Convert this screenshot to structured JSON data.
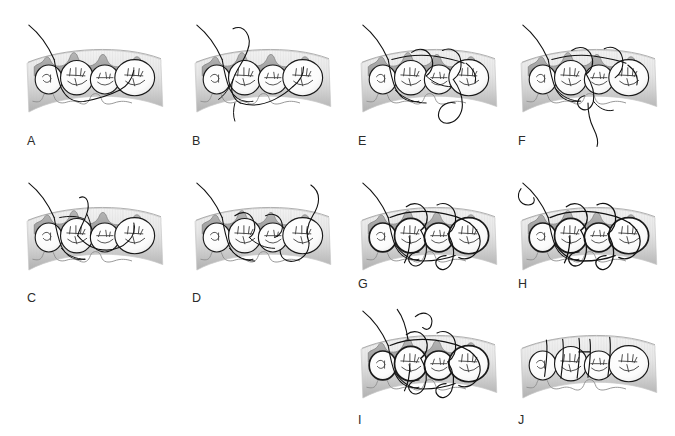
{
  "figure": {
    "background_color": "#ffffff",
    "panel_count": 10,
    "columns": 4,
    "rows": 3,
    "width": 675,
    "height": 436
  },
  "palette": {
    "background": "#ffffff",
    "tooth_fill": "#fdfdfd",
    "tooth_outline": "#1a1a1a",
    "gingiva_fill": "#a9a9a9",
    "gingiva_outline": "#7a7a7a",
    "band_light": "#f2f2f2",
    "band_mid": "#d4d4d4",
    "band_dark": "#b0b0b0",
    "suture_color": "#111111",
    "label_color": "#2b2b2b",
    "occlusal_line": "#444444"
  },
  "anatomy": {
    "arch_description": "curved buccal-occlusal view of a posterior dental arch segment",
    "tooth_count": 4,
    "teeth": [
      {
        "index": 1,
        "name": "premolar-distal-partial",
        "shape": "small-oval"
      },
      {
        "index": 2,
        "name": "first-molar",
        "shape": "large-oval"
      },
      {
        "index": 3,
        "name": "second-molar",
        "shape": "medium-oval"
      },
      {
        "index": 4,
        "name": "third-molar",
        "shape": "large-oval"
      }
    ],
    "gingiva": "scalloped interdental papillae along the crest with a reflected flap",
    "band": "vertically hatched gray mucosal band curving across each panel"
  },
  "panels": [
    {
      "id": "A",
      "label": "A",
      "row": 1,
      "column": 1,
      "x": 18,
      "y": 14,
      "label_x": 27,
      "label_y": 135,
      "caption": "Needle and suture thread enter from the upper left through the gingival flap; no loops formed yet.",
      "suture_elements": [
        "entry-thread-upper-left",
        "thread-under-flap",
        "thread-through-embrasure"
      ],
      "show_flap": true,
      "loops_above": 0,
      "loops_below": 0,
      "tail_below": false
    },
    {
      "id": "B",
      "label": "B",
      "row": 1,
      "column": 2,
      "x": 186,
      "y": 14,
      "label_x": 192,
      "label_y": 135,
      "caption": "Thread is passed back up and a large free loop is raised above the arch crest.",
      "suture_elements": [
        "entry-thread-upper-left",
        "large-loop-above-crest",
        "thread-around-first-molar",
        "thread-below-margin"
      ],
      "show_flap": true,
      "loops_above": 1,
      "loops_below": 1,
      "tail_below": false
    },
    {
      "id": "E",
      "label": "E",
      "row": 1,
      "column": 3,
      "x": 352,
      "y": 14,
      "label_x": 358,
      "label_y": 135,
      "caption": "Suture is carried around the distal teeth; a loop descends below the mucosal band on the right.",
      "suture_elements": [
        "entry-thread-upper-left",
        "sling-around-molars",
        "crest-loops",
        "large-loop-below-band"
      ],
      "show_flap": true,
      "loops_above": 2,
      "loops_below": 1,
      "tail_below": false
    },
    {
      "id": "F",
      "label": "F",
      "row": 1,
      "column": 4,
      "x": 512,
      "y": 14,
      "label_x": 518,
      "label_y": 135,
      "caption": "Loop is drawn down and the working end exits below the band as a free curved tail.",
      "suture_elements": [
        "entry-thread-upper-left",
        "sling-around-molars",
        "crest-loops",
        "free-tail-below"
      ],
      "show_flap": true,
      "loops_above": 2,
      "loops_below": 1,
      "tail_below": true
    },
    {
      "id": "C",
      "label": "C",
      "row": 2,
      "column": 1,
      "x": 18,
      "y": 172,
      "label_x": 27,
      "label_y": 292,
      "caption": "A narrow vertical loop is pulled upward between the second and third teeth.",
      "suture_elements": [
        "entry-thread-upper-left",
        "narrow-vertical-loop-above",
        "interdental-crossings",
        "thread-below-margin"
      ],
      "show_flap": true,
      "loops_above": 1,
      "loops_below": 1,
      "tail_below": false
    },
    {
      "id": "D",
      "label": "D",
      "row": 2,
      "column": 2,
      "x": 186,
      "y": 172,
      "label_x": 192,
      "label_y": 292,
      "caption": "The thread is carried distally around the last tooth and the free end rises at the right.",
      "suture_elements": [
        "entry-thread-upper-left",
        "crest-loops",
        "wrap-around-distal-tooth",
        "free-end-upper-right"
      ],
      "show_flap": true,
      "loops_above": 2,
      "loops_below": 1,
      "tail_below": false
    },
    {
      "id": "G",
      "label": "G",
      "row": 2,
      "column": 3,
      "x": 352,
      "y": 172,
      "label_x": 358,
      "label_y": 278,
      "caption": "Successive sling loops are seated around each tooth, with loops visible below the gingival margin.",
      "suture_elements": [
        "entry-thread-upper-left",
        "sling-loops-each-tooth",
        "sub-marginal-loops",
        "crest-loops"
      ],
      "show_flap": true,
      "loops_above": 3,
      "loops_below": 3,
      "tail_below": false
    },
    {
      "id": "H",
      "label": "H",
      "row": 2,
      "column": 4,
      "x": 512,
      "y": 172,
      "label_x": 518,
      "label_y": 278,
      "caption": "Sutures are tightened; the flap is adapted and multiple sub-marginal loops are engaged.",
      "suture_elements": [
        "entry-thread-upper-left",
        "tightened-sling-loops",
        "sub-marginal-loops",
        "bold-tooth-outlines"
      ],
      "show_flap": true,
      "loops_above": 3,
      "loops_below": 3,
      "tail_below": false
    },
    {
      "id": "I",
      "label": "I",
      "row": 3,
      "column": 3,
      "x": 352,
      "y": 300,
      "label_x": 358,
      "label_y": 414,
      "caption": "Both suture ends are brought together above the crest ready for knotting.",
      "suture_elements": [
        "entry-thread-upper-left",
        "second-free-end-above",
        "sling-loops-each-tooth",
        "sub-marginal-loops"
      ],
      "show_flap": true,
      "loops_above": 3,
      "loops_below": 3,
      "tail_below": false
    },
    {
      "id": "J",
      "label": "J",
      "row": 3,
      "column": 4,
      "x": 512,
      "y": 300,
      "label_x": 518,
      "label_y": 414,
      "caption": "Final result: sutures tied and trimmed, flap closed with vertical thread segments in each embrasure.",
      "suture_elements": [
        "vertical-tied-segments",
        "horizontal-tie-bar"
      ],
      "show_flap": false,
      "loops_above": 0,
      "loops_below": 0,
      "tail_below": false
    }
  ]
}
